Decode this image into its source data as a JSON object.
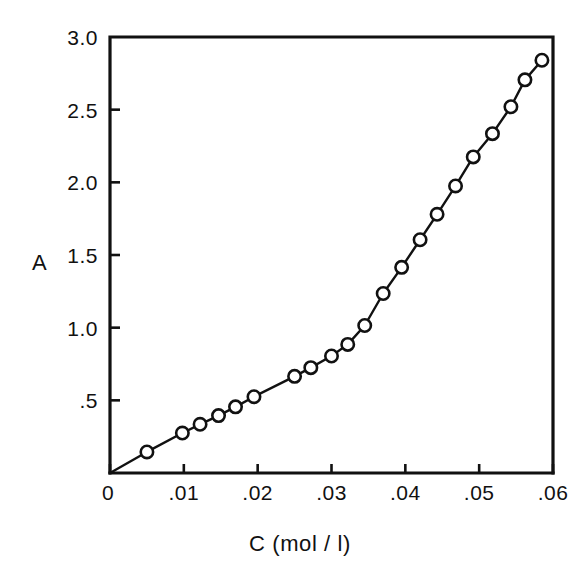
{
  "chart_data": {
    "type": "line",
    "title": "",
    "subtitle": "",
    "xlabel": "C (mol / l)",
    "ylabel": "A",
    "xlim": [
      0,
      0.06
    ],
    "ylim": [
      0,
      3.0
    ],
    "grid": false,
    "legend": null,
    "marker": "open-circle",
    "xticks": [
      0,
      0.01,
      0.02,
      0.03,
      0.04,
      0.05,
      0.06
    ],
    "xtick_labels": [
      "0",
      ".01",
      ".02",
      ".03",
      ".04",
      ".05",
      ".06"
    ],
    "yticks": [
      0,
      0.5,
      1.0,
      1.5,
      2.0,
      2.5,
      3.0
    ],
    "ytick_labels": [
      "0",
      ".5",
      "1.0",
      "1.5",
      "2.0",
      "2.5",
      "3.0"
    ],
    "series": [
      {
        "name": "A vs C",
        "x": [
          0.0,
          0.005,
          0.0098,
          0.0122,
          0.0147,
          0.017,
          0.0195,
          0.025,
          0.0272,
          0.03,
          0.0322,
          0.0345,
          0.037,
          0.0395,
          0.042,
          0.0443,
          0.0468,
          0.0492,
          0.0518,
          0.0543,
          0.0562,
          0.0585
        ],
        "y": [
          0.0,
          0.145,
          0.275,
          0.335,
          0.395,
          0.455,
          0.525,
          0.665,
          0.725,
          0.805,
          0.885,
          1.015,
          1.235,
          1.415,
          1.605,
          1.78,
          1.975,
          2.175,
          2.335,
          2.52,
          2.705,
          2.84
        ]
      }
    ]
  },
  "axes": {
    "y_title": "A",
    "x_title": "C (mol / l)"
  }
}
